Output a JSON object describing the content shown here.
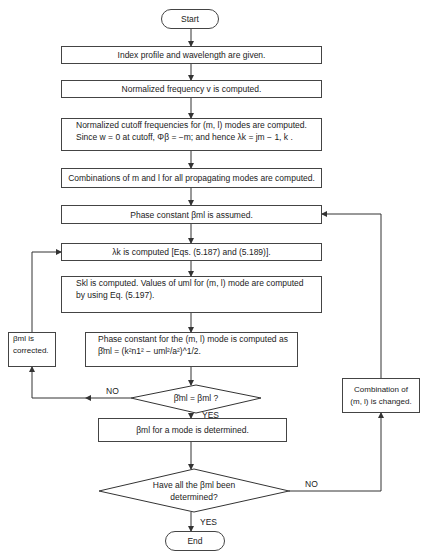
{
  "flowchart": {
    "start": "Start",
    "end": "End",
    "steps": {
      "index_profile": "Index profile and wavelength are given.",
      "normalized_freq": "Normalized frequency v is computed.",
      "cutoff_line1": "Normalized cutoff frequencies for (m, l)  modes are computed.",
      "cutoff_line2": "Since w = 0 at cutoff, Φβ = −m; and hence λk = jm − 1, k .",
      "combinations": "Combinations of m and l for all propagating modes are computed.",
      "phase_assumed": "Phase constant βml  is assumed.",
      "lambda_computed": "λk is computed [Eqs. (5.187) and (5.189)].",
      "s_line1": "Skl is computed.  Values of uml  for (m, l) mode are computed",
      "s_line2": "by using Eq. (5.197).",
      "phase_mode_line1": "Phase constant for the (m, l) mode is computed as",
      "phase_mode_line2": "β̂ml = (k²n1² − uml²/a²)^1/2.",
      "beta_corrected_line1": "βml is",
      "beta_corrected_line2": "corrected.",
      "beta_determined": "βml  for a mode is determined.",
      "combination_changed_line1": "Combination of",
      "combination_changed_line2": "(m, l) is changed."
    },
    "decisions": {
      "equal_check": "β̂ml = βml ?",
      "all_determined_line1": "Have all the βml  been",
      "all_determined_line2": "determined?"
    },
    "labels": {
      "no1": "NO",
      "yes1": "YES",
      "no2": "NO",
      "yes2": "YES"
    }
  }
}
